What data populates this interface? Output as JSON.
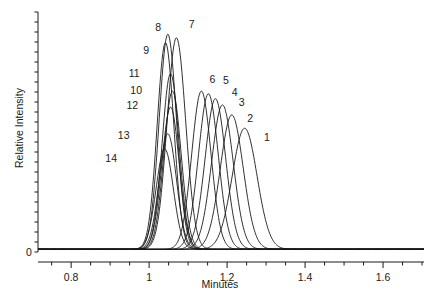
{
  "chart_data": {
    "type": "line",
    "title": "",
    "xlabel": "Minutes",
    "ylabel": "Relative Intensity",
    "xlim": [
      0.715,
      1.705
    ],
    "ylim": [
      0,
      1.08
    ],
    "grid": false,
    "legend": "none",
    "x_ticks_major": [
      "0.8",
      "1",
      "1.2",
      "1.4",
      "1.6"
    ],
    "x_ticks_major_values": [
      0.8,
      1.0,
      1.2,
      1.4,
      1.6
    ],
    "x_ticks_minor_step": 0.05,
    "y_ticks_labeled": [
      "0"
    ],
    "y_tick_minor_count": 24,
    "line_color": "#1a1a1a",
    "line_width": 0.9,
    "series": [
      {
        "name": "1",
        "retention_time": 1.245,
        "height": 0.545,
        "width": 0.075,
        "label_x": 1.305,
        "label_y": 0.515
      },
      {
        "name": "2",
        "retention_time": 1.212,
        "height": 0.605,
        "width": 0.069,
        "label_x": 1.262,
        "label_y": 0.6
      },
      {
        "name": "3",
        "retention_time": 1.188,
        "height": 0.65,
        "width": 0.065,
        "label_x": 1.24,
        "label_y": 0.672
      },
      {
        "name": "4",
        "retention_time": 1.17,
        "height": 0.678,
        "width": 0.062,
        "label_x": 1.222,
        "label_y": 0.717
      },
      {
        "name": "5",
        "retention_time": 1.152,
        "height": 0.7,
        "width": 0.06,
        "label_x": 1.2,
        "label_y": 0.768
      },
      {
        "name": "6",
        "retention_time": 1.134,
        "height": 0.712,
        "width": 0.058,
        "label_x": 1.165,
        "label_y": 0.772
      },
      {
        "name": "7",
        "retention_time": 1.07,
        "height": 0.952,
        "width": 0.056,
        "label_x": 1.112,
        "label_y": 1.02
      },
      {
        "name": "8",
        "retention_time": 1.048,
        "height": 0.968,
        "width": 0.052,
        "label_x": 1.026,
        "label_y": 1.01
      },
      {
        "name": "9",
        "retention_time": 1.042,
        "height": 0.93,
        "width": 0.05,
        "label_x": 0.995,
        "label_y": 0.905
      },
      {
        "name": "10",
        "retention_time": 1.06,
        "height": 0.712,
        "width": 0.052,
        "label_x": 0.962,
        "label_y": 0.725
      },
      {
        "name": "11",
        "retention_time": 1.055,
        "height": 0.79,
        "width": 0.051,
        "label_x": 0.958,
        "label_y": 0.8
      },
      {
        "name": "12",
        "retention_time": 1.055,
        "height": 0.64,
        "width": 0.052,
        "label_x": 0.952,
        "label_y": 0.658
      },
      {
        "name": "13",
        "retention_time": 1.048,
        "height": 0.52,
        "width": 0.052,
        "label_x": 0.93,
        "label_y": 0.52
      },
      {
        "name": "14",
        "retention_time": 1.04,
        "height": 0.452,
        "width": 0.052,
        "label_x": 0.898,
        "label_y": 0.418
      }
    ]
  },
  "axes": {
    "x_label": "Minutes",
    "y_label": "Relative Intensity",
    "y_zero_label": "0"
  }
}
